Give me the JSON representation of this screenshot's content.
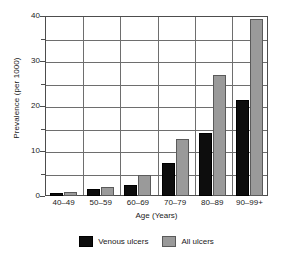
{
  "chart_data": {
    "type": "bar",
    "title": "",
    "subtitle": "",
    "xlabel": "Age (Years)",
    "ylabel": "Prevalence (per 1000)",
    "categories": [
      "40–49",
      "50–59",
      "60–69",
      "70–79",
      "80–89",
      "90–99+"
    ],
    "series": [
      {
        "name": "Venous ulcers",
        "color": "#0d0d0d",
        "values": [
          0.6,
          1.6,
          2.4,
          7.4,
          13.9,
          21.3
        ]
      },
      {
        "name": "All ulcers",
        "color": "#9a9a9a",
        "values": [
          0.8,
          1.9,
          4.6,
          12.6,
          27.0,
          39.4
        ]
      }
    ],
    "ylim": [
      0,
      40
    ],
    "yticks": [
      0,
      10,
      20,
      30,
      40
    ],
    "yticks_minor": [
      5,
      15,
      25,
      35
    ],
    "ytick_labels": [
      "0",
      "10",
      "20",
      "30",
      "40"
    ],
    "grid": true,
    "grid_axis": "both",
    "legend_position": "bottom"
  },
  "legend": {
    "items": [
      {
        "label": "Venous ulcers",
        "swatch": "black-square-swatch"
      },
      {
        "label": "All ulcers",
        "swatch": "gray-square-swatch"
      }
    ]
  }
}
